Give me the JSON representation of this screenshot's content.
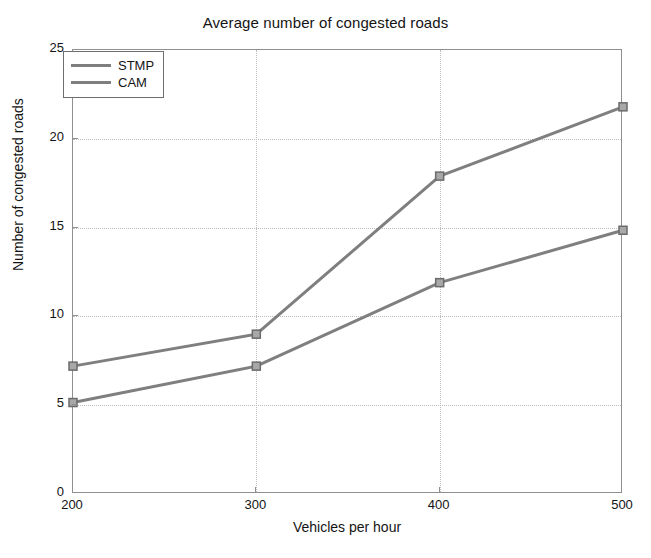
{
  "chart_data": {
    "type": "line",
    "title": "Average number of congested roads",
    "xlabel": "Vehicles per hour",
    "ylabel": "Number of congested roads",
    "x": [
      200,
      300,
      400,
      500
    ],
    "xticklabels": [
      "200",
      "300",
      "400",
      "500"
    ],
    "yticklabels": [
      "0",
      "5",
      "10",
      "15",
      "20",
      "25"
    ],
    "yticks": [
      0,
      5,
      10,
      15,
      20,
      25
    ],
    "xlim": [
      200,
      500
    ],
    "ylim": [
      0,
      25
    ],
    "grid": true,
    "legend_position": "upper left",
    "marker": "square",
    "series": [
      {
        "name": "STMP",
        "color": "#7f7f7f",
        "values": [
          7.2,
          9.0,
          17.9,
          21.8
        ]
      },
      {
        "name": "CAM",
        "color": "#7f7f7f",
        "values": [
          5.15,
          7.2,
          11.9,
          14.85
        ]
      }
    ]
  },
  "legend": {
    "items": [
      {
        "label": "STMP"
      },
      {
        "label": "CAM"
      }
    ]
  },
  "axes": {
    "line_color": "#8f8f8f",
    "grid_color": "#bdbdbd",
    "text_color": "#141414"
  }
}
